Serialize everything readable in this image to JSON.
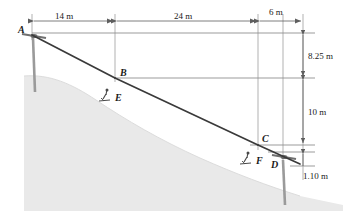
{
  "figure": {
    "kind": "ski-lift-cable-statics-diagram",
    "colors": {
      "hill_fill": "#e9e9e9",
      "cable": "#3a3a3a",
      "reference_line": "#8c8c8c",
      "dimension_line": "#6e6e6e",
      "tower": "#8a8a8a",
      "text": "#1a1a1a",
      "background": "#ffffff"
    }
  },
  "points": [
    {
      "id": "A",
      "label": "A",
      "x": 32,
      "y": 35,
      "lx": 18,
      "ly": 25,
      "has_tower": true,
      "has_skier": false
    },
    {
      "id": "B",
      "label": "B",
      "x": 115,
      "y": 78,
      "lx": 120,
      "ly": 68,
      "has_tower": false,
      "has_skier": false
    },
    {
      "id": "C",
      "label": "C",
      "x": 258,
      "y": 145,
      "lx": 262,
      "ly": 134,
      "has_tower": false,
      "has_skier": false
    },
    {
      "id": "D",
      "label": "D",
      "x": 283,
      "y": 158,
      "lx": 271,
      "ly": 160,
      "has_tower": true,
      "has_skier": false
    },
    {
      "id": "E",
      "label": "E",
      "x": 106,
      "y": 97,
      "lx": 115,
      "ly": 93,
      "has_tower": false,
      "has_skier": true
    },
    {
      "id": "F",
      "label": "F",
      "x": 247,
      "y": 160,
      "lx": 256,
      "ly": 156,
      "has_tower": false,
      "has_skier": true
    }
  ],
  "cable_segments": [
    {
      "name": "segment-A-B",
      "from": "A",
      "to": "B"
    },
    {
      "name": "segment-B-C",
      "from": "B",
      "to": "C"
    },
    {
      "name": "segment-C-D",
      "from": "C",
      "to": "D"
    }
  ],
  "horizontal_dimensions": [
    {
      "id": "h1",
      "label": "14 m",
      "x1": 32,
      "x2": 115,
      "y": 21,
      "tx": 55,
      "ty": 14
    },
    {
      "id": "h2",
      "label": "24 m",
      "x1": 115,
      "x2": 258,
      "y": 21,
      "tx": 174,
      "ty": 14
    },
    {
      "id": "h3",
      "label": "6 m",
      "x1": 258,
      "x2": 303,
      "y": 21,
      "tx": 269,
      "ty": 10
    }
  ],
  "vertical_dimensions": [
    {
      "id": "v1",
      "label": "8.25 m",
      "x": 303,
      "y1": 33,
      "y2": 78,
      "tx": 308,
      "ty": 52
    },
    {
      "id": "v2",
      "label": "10 m",
      "x": 303,
      "y1": 78,
      "y2": 145,
      "tx": 308,
      "ty": 108
    },
    {
      "id": "v3",
      "label": "1.10 m",
      "x": 303,
      "y1": 152,
      "y2": 166,
      "tx": 304,
      "ty": 172
    }
  ],
  "reference_lines": [
    {
      "id": "ref-top",
      "x1": 32,
      "y1": 33,
      "x2": 315,
      "y2": 33
    },
    {
      "id": "ref-at-B",
      "x1": 115,
      "y1": 78,
      "x2": 315,
      "y2": 78
    },
    {
      "id": "ref-at-C",
      "x1": 250,
      "y1": 145,
      "x2": 315,
      "y2": 145
    },
    {
      "id": "ref-lower-D",
      "x1": 268,
      "y1": 152,
      "x2": 315,
      "y2": 152
    },
    {
      "id": "ref-bottom",
      "x1": 290,
      "y1": 166,
      "x2": 315,
      "y2": 166
    }
  ],
  "extension_lines": [
    {
      "id": "ext-A",
      "x": 32,
      "y1": 14,
      "y2": 40
    },
    {
      "id": "ext-B",
      "x": 115,
      "y1": 14,
      "y2": 82
    },
    {
      "id": "ext-C",
      "x": 258,
      "y1": 14,
      "y2": 150
    },
    {
      "id": "ext-D",
      "x": 283,
      "y1": 14,
      "y2": 160
    },
    {
      "id": "ext-R",
      "x": 303,
      "y1": 14,
      "y2": 180
    }
  ]
}
